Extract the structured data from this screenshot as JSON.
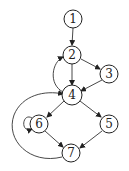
{
  "diagram": {
    "type": "control-flow-graph",
    "nodes": [
      {
        "id": "1",
        "label": "1",
        "x": 73,
        "y": 19
      },
      {
        "id": "2",
        "label": "2",
        "x": 72,
        "y": 55
      },
      {
        "id": "3",
        "label": "3",
        "x": 109,
        "y": 74
      },
      {
        "id": "4",
        "label": "4",
        "x": 72,
        "y": 95
      },
      {
        "id": "5",
        "label": "5",
        "x": 109,
        "y": 124
      },
      {
        "id": "6",
        "label": "6",
        "x": 39,
        "y": 124
      },
      {
        "id": "7",
        "label": "7",
        "x": 71,
        "y": 153
      }
    ],
    "edges": [
      {
        "from": "1",
        "to": "2"
      },
      {
        "from": "2",
        "to": "3"
      },
      {
        "from": "2",
        "to": "4"
      },
      {
        "from": "3",
        "to": "4"
      },
      {
        "from": "4",
        "to": "2"
      },
      {
        "from": "4",
        "to": "6"
      },
      {
        "from": "4",
        "to": "5"
      },
      {
        "from": "6",
        "to": "6"
      },
      {
        "from": "6",
        "to": "7"
      },
      {
        "from": "5",
        "to": "7"
      },
      {
        "from": "7",
        "to": "4"
      }
    ]
  }
}
